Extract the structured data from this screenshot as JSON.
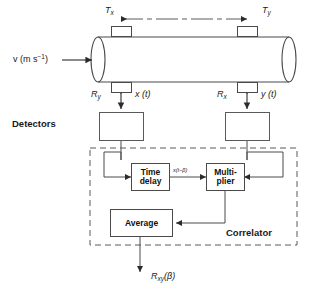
{
  "diagram": {
    "pipe": {
      "flow_label": "v (m s",
      "flow_label_sup": "−1",
      "flow_label_tail": ")"
    },
    "transducers": {
      "tx_label": "T",
      "tx_sub": "x",
      "ty_label": "T",
      "ty_sub": "y",
      "ry_label": "R",
      "ry_sub": "y",
      "rx_label": "R",
      "rx_sub": "x"
    },
    "signals": {
      "x_of_t": "x (t)",
      "y_of_t": "y (t)",
      "delayed": "x(t−β)",
      "output": "R",
      "output_sub": "xy",
      "output_arg": "(β)"
    },
    "labels": {
      "detectors": "Detectors",
      "correlator": "Correlator"
    },
    "blocks": {
      "time_delay": "Time\ndelay",
      "time_delay_line1": "Time",
      "time_delay_line2": "delay",
      "multiplier_line1": "Multi-",
      "multiplier_line2": "plier",
      "average": "Average",
      "detector_left": "",
      "detector_right": ""
    },
    "colors": {
      "stroke": "#4a4a4a",
      "text": "#1a1a1a",
      "background": "#ffffff"
    }
  }
}
